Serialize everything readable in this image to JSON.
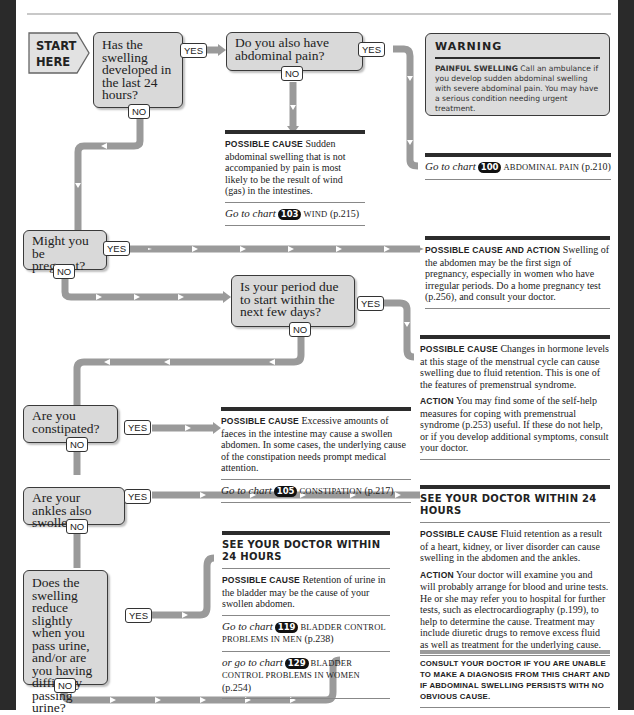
{
  "start": {
    "line1": "START",
    "line2": "HERE"
  },
  "labels": {
    "yes": "YES",
    "no": "NO"
  },
  "questions": [
    {
      "id": "q1",
      "text": "Has the swelling developed in the last 24 hours?"
    },
    {
      "id": "q2",
      "text": "Do you also have abdominal pain?"
    },
    {
      "id": "q3",
      "text": "Might you be pregnant?"
    },
    {
      "id": "q4",
      "text": "Is your period due to start within the next few days?"
    },
    {
      "id": "q5",
      "text": "Are you constipated?"
    },
    {
      "id": "q6",
      "text": "Are your ankles also swollen?"
    },
    {
      "id": "q7",
      "text": "Does the swelling reduce slightly when you pass urine, and/or are you having difficulty passing urine?"
    }
  ],
  "warning": {
    "title": "WARNING",
    "lead": "PAINFUL SWELLING",
    "text": "Call an ambulance if you develop sudden abdominal swelling with severe abdominal pain. You may have a serious condition needing urgent treatment."
  },
  "outcomes": {
    "abdominal_pain": {
      "goto_prefix": "Go to chart",
      "chart_no": "100",
      "chart_name": "ABDOMINAL PAIN",
      "page": "(p.210)"
    },
    "wind": {
      "lead": "POSSIBLE CAUSE",
      "text": "Sudden abdominal swelling that is not accompanied by pain is most likely to be the result of wind (gas) in the intestines.",
      "goto_prefix": "Go to chart",
      "chart_no": "103",
      "chart_name": "WIND",
      "page": "(p.215)"
    },
    "pregnancy": {
      "lead": "POSSIBLE CAUSE AND ACTION",
      "text": "Swelling of the abdomen may be the first sign of pregnancy, especially in women who have irregular periods. Do a home pregnancy test (p.256), and consult your doctor."
    },
    "premenstrual": {
      "lead": "POSSIBLE CAUSE",
      "text": "Changes in hormone levels at this stage of the menstrual cycle can cause swelling due to fluid retention. This is one of the features of premenstrual syndrome.",
      "action_lead": "ACTION",
      "action_text": "You may find some of the self-help measures for coping with premenstrual syndrome (p.253) useful. If these do not help, or if you develop additional symptoms, consult your doctor."
    },
    "constipation": {
      "lead": "POSSIBLE CAUSE",
      "text": "Excessive amounts of faeces in the intestine may cause a swollen abdomen. In some cases, the underlying cause of the constipation needs prompt medical attention.",
      "goto_prefix": "Go to chart",
      "chart_no": "105",
      "chart_name": "CONSTIPATION",
      "page": "(p.217)"
    },
    "fluid_retention": {
      "heading": "SEE YOUR DOCTOR WITHIN 24 HOURS",
      "lead": "POSSIBLE CAUSE",
      "text": "Fluid retention as a result of a heart, kidney, or liver disorder can cause swelling in the abdomen and the ankles.",
      "action_lead": "ACTION",
      "action_text": "Your doctor will examine you and will probably arrange for blood and urine tests. He or she may refer you to hospital for further tests, such as electrocardiography (p.199), to help to determine the cause. Treatment may include diuretic drugs to remove excess fluid as well as treatment for the underlying cause."
    },
    "urine_retention": {
      "heading": "SEE YOUR DOCTOR WITHIN 24 HOURS",
      "lead": "POSSIBLE CAUSE",
      "text": "Retention of urine in the bladder may be the cause of your swollen abdomen.",
      "goto_prefix": "Go to chart",
      "chart_no": "119",
      "chart_name": "BLADDER CONTROL PROBLEMS IN MEN",
      "page": "(p.238)",
      "alt_goto_prefix": "or go to chart",
      "alt_chart_no": "129",
      "alt_chart_name": "BLADDER CONTROL PROBLEMS IN WOMEN",
      "alt_page": "(p.254)"
    },
    "consult": {
      "text": "CONSULT YOUR DOCTOR IF YOU ARE UNABLE TO MAKE A DIAGNOSIS FROM THIS CHART AND IF ABDOMINAL SWELLING PERSISTS WITH NO OBVIOUS CAUSE."
    }
  },
  "colors": {
    "connector": "#9a9a9a",
    "box_fill": "#d9d9d9",
    "border": "#3a3a3a",
    "edge": "#2a2a2a"
  }
}
